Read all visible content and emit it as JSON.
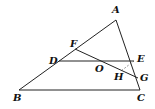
{
  "figure": {
    "type": "triangle-geometry",
    "points": {
      "A": {
        "label": "A",
        "x": 116,
        "y": 20,
        "lx": 112,
        "ly": 13
      },
      "B": {
        "label": "B",
        "x": 19,
        "y": 90,
        "lx": 13,
        "ly": 101
      },
      "C": {
        "label": "C",
        "x": 140,
        "y": 90,
        "lx": 137,
        "ly": 101
      },
      "D": {
        "label": "D",
        "x": 59,
        "y": 61,
        "lx": 49,
        "ly": 64
      },
      "E": {
        "label": "E",
        "x": 134,
        "y": 61,
        "lx": 137,
        "ly": 62
      },
      "F": {
        "label": "F",
        "x": 75,
        "y": 49,
        "lx": 70,
        "ly": 47
      },
      "O": {
        "label": "O",
        "x": 101,
        "y": 61,
        "lx": 95,
        "ly": 72
      },
      "G": {
        "label": "G",
        "x": 138,
        "y": 78,
        "lx": 140,
        "ly": 81
      },
      "H": {
        "label": "H",
        "x": 121,
        "y": 71,
        "lx": 114,
        "ly": 80
      }
    },
    "segments": [
      {
        "from": "A",
        "to": "B",
        "style": "solid"
      },
      {
        "from": "A",
        "to": "C",
        "style": "solid"
      },
      {
        "from": "B",
        "to": "C",
        "style": "solid"
      },
      {
        "from": "D",
        "to": "E",
        "style": "solid"
      },
      {
        "from": "F",
        "to": "G",
        "style": "solid"
      },
      {
        "from": "E",
        "to": "H",
        "style": "dashed"
      }
    ],
    "labels": {
      "A": "A",
      "B": "B",
      "C": "C",
      "D": "D",
      "E": "E",
      "F": "F",
      "O": "O",
      "G": "G",
      "H": "H"
    }
  }
}
